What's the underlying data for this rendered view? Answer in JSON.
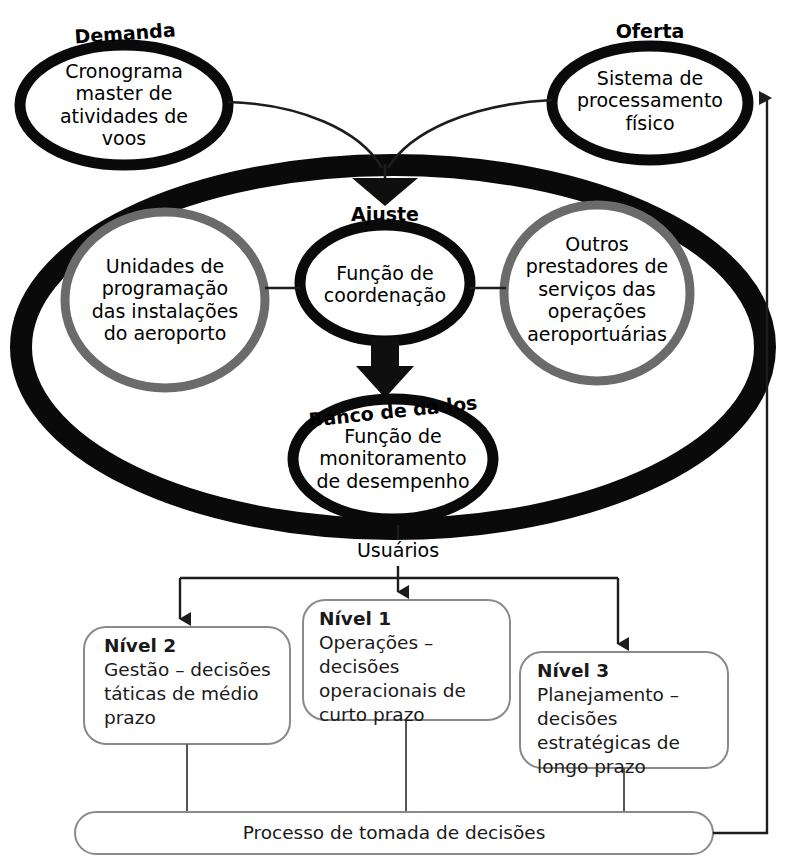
{
  "diagram": {
    "language": "pt-BR",
    "colors": {
      "ink": "#000000",
      "gray_ring": "#6b6b6b",
      "box_stroke": "#8a8a8a",
      "connector": "#222222",
      "background": "#ffffff"
    }
  },
  "captions": {
    "demanda": "Demanda",
    "oferta": "Oferta",
    "ajuste": "Ajuste",
    "banco": "Banco de dados",
    "usuarios": "Usuários"
  },
  "nodes": {
    "demand": {
      "label": "Cronograma\nmaster de\natividades de\nvoos"
    },
    "supply": {
      "label": "Sistema de\nprocessamento\nfísico"
    },
    "units": {
      "label": "Unidades de\nprogramação\ndas instalações\ndo aeroporto"
    },
    "coordination": {
      "label": "Função de\ncoordenação"
    },
    "providers": {
      "label": "Outros\nprestadores de\nserviços das\noperações\naeroportuárias"
    },
    "monitoring": {
      "label": "Função de\nmonitoramento\nde desempenho"
    }
  },
  "levels": [
    {
      "id": "nivel-2",
      "title": "Nível 2",
      "body": "Gestão – decisões táticas de médio prazo"
    },
    {
      "id": "nivel-1",
      "title": "Nível 1",
      "body": "Operações – decisões operacionais de curto prazo"
    },
    {
      "id": "nivel-3",
      "title": "Nível 3",
      "body": "Planejamento – decisões estratégicas de longo prazo"
    }
  ],
  "footer": {
    "process_label": "Processo de tomada de decisões"
  }
}
